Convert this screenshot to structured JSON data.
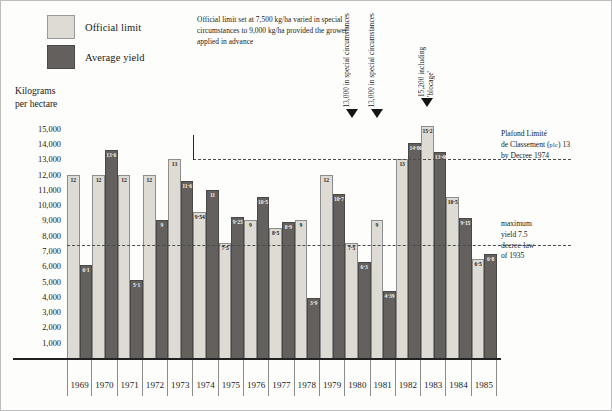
{
  "legend": {
    "items": [
      {
        "label": "Official limit",
        "color": "#dedbd4",
        "key": "official"
      },
      {
        "label": "Average yield",
        "color": "#63605d",
        "key": "average"
      }
    ]
  },
  "axis_title": {
    "line1": "Kilograms",
    "line2": "per hectare"
  },
  "notes": {
    "top": "Official limit set at 7,500 kg/ha varied in special circumstances to 9,000 kg/ha provided the grower applied in advance",
    "plc_line1": "Plafond Limité",
    "plc_line2a": "de Classement (",
    "plc_smallcaps": "plc",
    "plc_line2b": ") 13",
    "plc_line3": "by Decree 1974",
    "max_line1": "maximum",
    "max_line2": "yield 7.5",
    "max_line3": "decree-law",
    "max_line4": "of 1935"
  },
  "callouts": [
    {
      "text": "13,000 in special circumstances",
      "year": "1980"
    },
    {
      "text": "13,000 in special circumstances",
      "year": "1981"
    },
    {
      "text": "15,200 including 'blocage'",
      "year": "1983"
    }
  ],
  "chart_data": {
    "type": "bar",
    "title": "",
    "xlabel": "",
    "ylabel": "Kilograms per hectare",
    "ylim": [
      0,
      15500
    ],
    "grid": false,
    "legend_position": "top-left",
    "categories": [
      "1969",
      "1970",
      "1971",
      "1972",
      "1973",
      "1974",
      "1975",
      "1976",
      "1977",
      "1978",
      "1979",
      "1980",
      "1981",
      "1982",
      "1983",
      "1984",
      "1985"
    ],
    "series": [
      {
        "name": "Official limit",
        "color": "#dedbd4",
        "values": [
          12,
          12,
          12,
          12,
          13,
          9.54,
          7.5,
          9,
          8.5,
          9,
          12,
          7.5,
          9,
          13,
          15.2,
          10.5,
          6.5
        ],
        "labels": [
          "12",
          "12",
          "12",
          "12",
          "13",
          "9·54",
          "7·5",
          "9",
          "8·5",
          "9",
          "12",
          "7·5",
          "9",
          "13",
          "15·2",
          "10·5",
          "6·5"
        ]
      },
      {
        "name": "Average yield",
        "color": "#63605d",
        "values": [
          6.1,
          13.6,
          5.1,
          9,
          11.6,
          11,
          9.25,
          10.5,
          8.9,
          3.9,
          10.7,
          6.3,
          4.39,
          14.06,
          13.46,
          9.15,
          6.8
        ],
        "labels": [
          "6·1",
          "13·6",
          "5·1",
          "9",
          "11·6",
          "11",
          "9·25",
          "10·5",
          "8·9",
          "3·9",
          "10·7",
          "6·3",
          "4·39",
          "14·06",
          "13·46",
          "9·15",
          "6·8"
        ]
      }
    ],
    "y_ticks": [
      {
        "value": 15000,
        "label": "15,000"
      },
      {
        "value": 14000,
        "label": "14,000"
      },
      {
        "value": 13000,
        "label": "13,000"
      },
      {
        "value": 12000,
        "label": "12,000"
      },
      {
        "value": 11000,
        "label": "11,000"
      },
      {
        "value": 10000,
        "label": "10,000"
      },
      {
        "value": 9000,
        "label": "9,000"
      },
      {
        "value": 8000,
        "label": "8,000"
      },
      {
        "value": 7000,
        "label": "7,000"
      },
      {
        "value": 6000,
        "label": "6,000"
      },
      {
        "value": 5000,
        "label": "5,000"
      },
      {
        "value": 4000,
        "label": "4,000"
      },
      {
        "value": 3000,
        "label": "3,000"
      },
      {
        "value": 2000,
        "label": "2,000"
      },
      {
        "value": 1000,
        "label": "1,000"
      }
    ],
    "reference_lines": [
      {
        "value": 13000,
        "label": "Plafond Limité de Classement (PLC) 13 by Decree 1974",
        "start_category": "1974"
      },
      {
        "value": 7400,
        "label": "maximum yield 7.5 decree-law of 1935",
        "start_category": "1969"
      }
    ]
  }
}
